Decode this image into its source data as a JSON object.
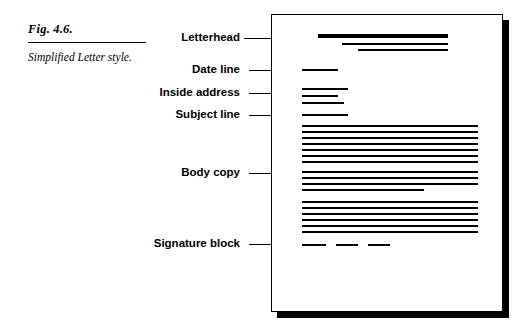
{
  "figure": {
    "number": "Fig. 4.6.",
    "description": "Simplified Letter style."
  },
  "labels": [
    {
      "text": "Letterhead",
      "name": "label-letterhead",
      "top": 31,
      "leader_top": 38,
      "leader_left": 244,
      "leader_width": 74
    },
    {
      "text": "Date line",
      "name": "label-date-line",
      "top": 63,
      "leader_top": 70,
      "leader_left": 249,
      "leader_width": 46
    },
    {
      "text": "Inside address",
      "name": "label-inside-address",
      "top": 86,
      "leader_top": 93,
      "leader_left": 249,
      "leader_width": 46
    },
    {
      "text": "Subject line",
      "name": "label-subject-line",
      "top": 108,
      "leader_top": 115,
      "leader_left": 249,
      "leader_width": 46
    },
    {
      "text": "Body  copy",
      "name": "label-body-copy",
      "top": 166,
      "leader_top": 173,
      "leader_left": 249,
      "leader_width": 46
    },
    {
      "text": "Signature block",
      "name": "label-signature-block",
      "top": 237,
      "leader_top": 244,
      "leader_left": 249,
      "leader_width": 46
    }
  ],
  "sheet": {
    "letterhead_lines": [
      {
        "left": 46,
        "top": 19,
        "width": 130,
        "height": 4
      },
      {
        "left": 70,
        "top": 28,
        "width": 106,
        "height": 2
      },
      {
        "left": 86,
        "top": 34,
        "width": 90,
        "height": 2
      }
    ],
    "date_lines": [
      {
        "left": 30,
        "top": 54,
        "width": 36,
        "height": 2
      }
    ],
    "inside_address_lines": [
      {
        "left": 30,
        "top": 73,
        "width": 46,
        "height": 2
      },
      {
        "left": 30,
        "top": 80,
        "width": 36,
        "height": 2
      },
      {
        "left": 30,
        "top": 87,
        "width": 42,
        "height": 2
      }
    ],
    "subject_lines": [
      {
        "left": 30,
        "top": 99,
        "width": 46,
        "height": 2
      }
    ],
    "body_lines": [
      {
        "left": 30,
        "top": 110,
        "width": 176,
        "height": 2
      },
      {
        "left": 30,
        "top": 116,
        "width": 176,
        "height": 2
      },
      {
        "left": 30,
        "top": 122,
        "width": 176,
        "height": 2
      },
      {
        "left": 30,
        "top": 128,
        "width": 176,
        "height": 2
      },
      {
        "left": 30,
        "top": 134,
        "width": 176,
        "height": 2
      },
      {
        "left": 30,
        "top": 140,
        "width": 176,
        "height": 2
      },
      {
        "left": 30,
        "top": 146,
        "width": 176,
        "height": 2
      },
      {
        "left": 30,
        "top": 156,
        "width": 176,
        "height": 2
      },
      {
        "left": 30,
        "top": 162,
        "width": 176,
        "height": 2
      },
      {
        "left": 30,
        "top": 168,
        "width": 176,
        "height": 2
      },
      {
        "left": 30,
        "top": 174,
        "width": 122,
        "height": 2
      },
      {
        "left": 30,
        "top": 186,
        "width": 176,
        "height": 2
      },
      {
        "left": 30,
        "top": 192,
        "width": 176,
        "height": 2
      },
      {
        "left": 30,
        "top": 198,
        "width": 176,
        "height": 2
      },
      {
        "left": 30,
        "top": 204,
        "width": 176,
        "height": 2
      },
      {
        "left": 30,
        "top": 210,
        "width": 176,
        "height": 2
      },
      {
        "left": 30,
        "top": 216,
        "width": 176,
        "height": 2
      }
    ],
    "signature_lines": [
      {
        "left": 30,
        "top": 229,
        "width": 24,
        "height": 2
      },
      {
        "left": 64,
        "top": 229,
        "width": 22,
        "height": 2
      },
      {
        "left": 96,
        "top": 229,
        "width": 22,
        "height": 2
      }
    ]
  }
}
